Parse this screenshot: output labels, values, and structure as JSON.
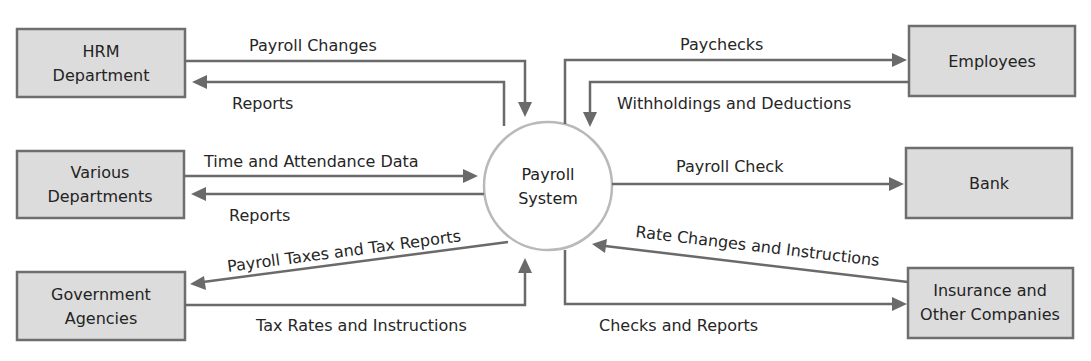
{
  "diagram": {
    "type": "context data flow diagram",
    "process": {
      "line1": "Payroll",
      "line2": "System"
    },
    "entities": {
      "hrm": {
        "line1": "HRM",
        "line2": "Department"
      },
      "various": {
        "line1": "Various",
        "line2": "Departments"
      },
      "government": {
        "line1": "Government",
        "line2": "Agencies"
      },
      "employees": {
        "line1": "Employees"
      },
      "bank": {
        "line1": "Bank"
      },
      "insurance": {
        "line1": "Insurance and",
        "line2": "Other Companies"
      }
    },
    "flows": {
      "payroll_changes": "Payroll Changes",
      "hrm_reports": "Reports",
      "time_attendance": "Time and Attendance Data",
      "dept_reports": "Reports",
      "payroll_taxes": "Payroll Taxes and Tax Reports",
      "tax_rates": "Tax Rates and Instructions",
      "paychecks": "Paychecks",
      "withholdings": "Withholdings and Deductions",
      "payroll_check": "Payroll Check",
      "rate_changes": "Rate Changes and Instructions",
      "checks_reports": "Checks and Reports"
    },
    "colors": {
      "entity_fill": "#dcdcdc",
      "entity_border": "#6e6e6e",
      "process_border": "#b9b9b9",
      "line": "#6a6a6a",
      "text": "#232323"
    }
  }
}
